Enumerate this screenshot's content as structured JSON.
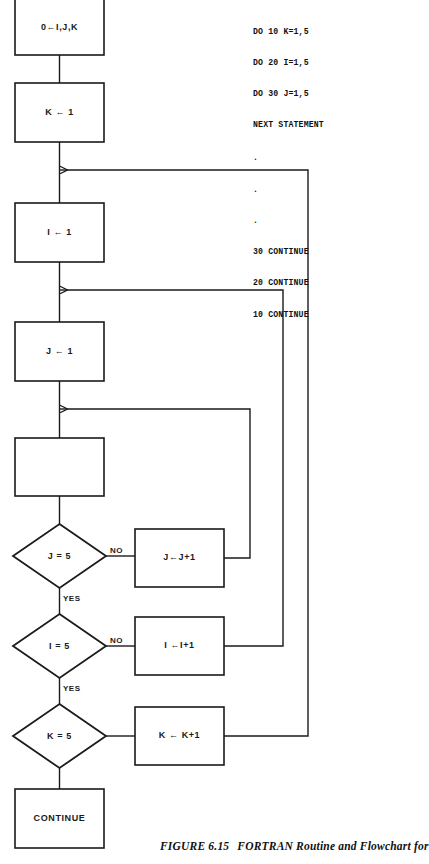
{
  "figure": {
    "caption_number": "FIGURE 6.15",
    "caption_text": "FORTRAN Routine and Flowchart for"
  },
  "code": {
    "lines": [
      "DO 10 K=1,5",
      "DO 20 I=1,5",
      "DO 30 J=1,5",
      "NEXT STATEMENT"
    ],
    "ellipsis": [
      ".",
      ".",
      "."
    ],
    "continue_lines": [
      "30 CONTINUE",
      "20 CONTINUE",
      "10 CONTINUE"
    ]
  },
  "flowchart": {
    "nodes": {
      "init": "0←I,J,K",
      "k_init": "K ← 1",
      "i_init": "I ← 1",
      "j_init": "J ← 1",
      "next_statement": "",
      "j_test": "J = 5",
      "i_test": "I = 5",
      "k_test": "K = 5",
      "j_incr": "J←J+1",
      "i_incr": "I ←I+1",
      "k_incr": "K ← K+1",
      "continue": "CONTINUE"
    },
    "edge_labels": {
      "j_no": "NO",
      "j_yes": "YES",
      "i_no": "NO",
      "i_yes": "YES"
    },
    "colors": {
      "stroke": "#1a1a1a",
      "fill": "#ffffff"
    }
  }
}
